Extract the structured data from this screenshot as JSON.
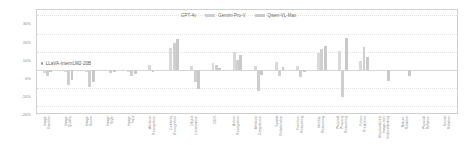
{
  "chart_data": {
    "type": "bar",
    "title": "",
    "subtitle": "",
    "xlabel": "",
    "ylabel": "",
    "ylim": [
      -25,
      33
    ],
    "grid": true,
    "legend_position": "top-center",
    "ytick_labels": [
      "30%",
      "20%",
      "10%",
      "0%",
      "-10%",
      "-20%"
    ],
    "ytick_values": [
      30,
      20,
      10,
      0,
      -10,
      -20
    ],
    "categories": [
      "Image Emotion",
      "Image Quality",
      "Image Scene",
      "Image Style",
      "Image Topic",
      "Attribute Recognition",
      "Celebrity Recognition",
      "Object Localization",
      "OCR",
      "Action Recognition",
      "Attribute Comparison",
      "Spatial Relationship",
      "Function Reasoning",
      "Identity Reasoning",
      "Physical Property Reasoning",
      "Future Prediction",
      "Structuralized Image-text Understanding",
      "Nature Relation",
      "Physical Relation",
      "Social Relation"
    ],
    "series": [
      {
        "name": "GPT-4v",
        "color": "#d9d9d9",
        "values": [
          -2,
          -1,
          -1,
          -0.5,
          -1.5,
          2.5,
          12,
          2,
          4,
          10,
          2,
          4.5,
          2,
          9,
          10.5,
          5,
          0,
          0,
          0,
          0
        ]
      },
      {
        "name": "Gemini-Pro-V",
        "color": "#cfcfcf",
        "values": [
          -3.5,
          -8.5,
          -9.5,
          -2,
          -3.5,
          -1,
          14.5,
          -7,
          2.5,
          5.5,
          -12,
          -3.5,
          -4,
          11.5,
          -15,
          12.5,
          0,
          0,
          0,
          0
        ]
      },
      {
        "name": "Qwen-VL-Max",
        "color": "#c9c9c9",
        "values": [
          -1.5,
          -5.5,
          -6.5,
          -1,
          -2.5,
          0,
          17,
          -10.5,
          1,
          8,
          -3,
          1.5,
          -1,
          13,
          17.5,
          7,
          -6,
          -3.5,
          0,
          0
        ]
      }
    ],
    "annotation": {
      "label": "LLaVA-InternLM2-20B",
      "marker": "dot"
    }
  },
  "legend": {
    "items": [
      {
        "label": "GPT-4v",
        "color": "#d9d9d9"
      },
      {
        "label": "Gemini-Pro-V",
        "color": "#cfcfcf"
      },
      {
        "label": "Qwen-VL-Max",
        "color": "#c9c9c9"
      }
    ]
  },
  "axes": {
    "y_ticks": [
      {
        "label": "30%",
        "value": 30
      },
      {
        "label": "20%",
        "value": 20
      },
      {
        "label": "10%",
        "value": 10
      },
      {
        "label": "0%",
        "value": 0
      },
      {
        "label": "-10%",
        "value": -10
      },
      {
        "label": "-20%",
        "value": -20
      }
    ],
    "x_ticks": [
      "Image Emotion",
      "Image Quality",
      "Image Scene",
      "Image Style",
      "Image Topic",
      "Attribute Recognition",
      "Celebrity Recognition",
      "Object Localization",
      "OCR",
      "Action Recognition",
      "Attribute Comparison",
      "Spatial Relationship",
      "Function Reasoning",
      "Identity Reasoning",
      "Physical Property Reasoning",
      "Future Prediction",
      "Structuralized Image-text Understanding",
      "Nature Relation",
      "Physical Relation",
      "Social Relation"
    ]
  },
  "annotation": {
    "text": "LLaVA-InternLM2-20B"
  }
}
